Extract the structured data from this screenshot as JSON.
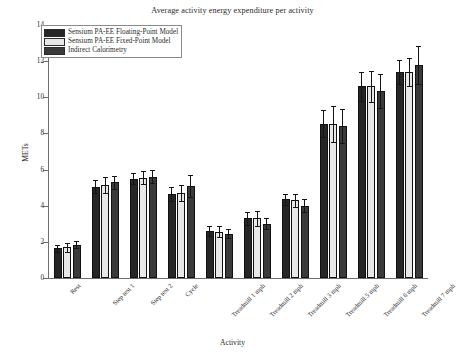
{
  "chart_data": {
    "type": "bar",
    "title": "Average activity energy expenditure per activity",
    "xlabel": "Activity",
    "ylabel": "METs",
    "ylim": [
      0,
      14
    ],
    "yticks": [
      0,
      2,
      4,
      6,
      8,
      10,
      12,
      14
    ],
    "grid": false,
    "legend_position": "upper left",
    "categories": [
      "Rest",
      "Step test 1",
      "Step test 2",
      "Cycle",
      "Treadmill 1 mph",
      "Treadmill 2 mph",
      "Treadmill 3 mph",
      "Treadmill 5 mph",
      "Treadmill 6 mph",
      "Treadmill 7 mph"
    ],
    "series": [
      {
        "name": "Sensium PA-EE Floating-Point Model",
        "color": "#262626",
        "values": [
          1.65,
          5.05,
          5.5,
          4.65,
          2.6,
          3.3,
          4.35,
          8.55,
          10.6,
          11.4
        ],
        "errors": [
          0.2,
          0.35,
          0.3,
          0.4,
          0.25,
          0.35,
          0.3,
          0.75,
          0.8,
          0.65
        ]
      },
      {
        "name": "Sensium PA-EE Fixed-Point Model",
        "color": "#e8e8e8",
        "values": [
          1.7,
          5.15,
          5.55,
          4.7,
          2.55,
          3.3,
          4.3,
          8.5,
          10.6,
          11.4
        ],
        "errors": [
          0.25,
          0.45,
          0.35,
          0.45,
          0.3,
          0.4,
          0.35,
          1.0,
          0.85,
          0.75
        ]
      },
      {
        "name": "Indirect Calorimetry",
        "color": "#3a3a3a",
        "values": [
          1.85,
          5.3,
          5.6,
          5.1,
          2.45,
          3.0,
          4.0,
          8.4,
          10.35,
          11.8
        ],
        "errors": [
          0.2,
          0.35,
          0.35,
          0.6,
          0.25,
          0.3,
          0.35,
          0.95,
          0.95,
          1.05
        ]
      }
    ]
  },
  "legend": {
    "items": [
      {
        "label": "Sensium PA-EE Floating-Point Model",
        "color": "#262626"
      },
      {
        "label": "Sensium PA-EE Fixed-Point Model",
        "color": "#e8e8e8"
      },
      {
        "label": "Indirect Calorimetry",
        "color": "#3a3a3a"
      }
    ]
  }
}
